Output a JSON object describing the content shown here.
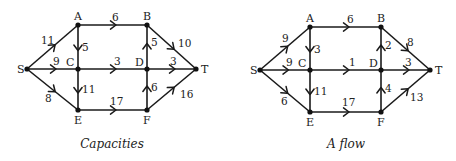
{
  "graphs": [
    {
      "caption": "Capacities",
      "nodes": [
        {
          "id": "S",
          "x": 27,
          "y": 69,
          "lx": 17,
          "ly": 73
        },
        {
          "id": "A",
          "x": 78,
          "y": 25,
          "lx": 74,
          "ly": 20
        },
        {
          "id": "B",
          "x": 147,
          "y": 25,
          "lx": 143,
          "ly": 20
        },
        {
          "id": "C",
          "x": 78,
          "y": 69,
          "lx": 66,
          "ly": 66
        },
        {
          "id": "D",
          "x": 147,
          "y": 69,
          "lx": 135,
          "ly": 66
        },
        {
          "id": "T",
          "x": 196,
          "y": 69,
          "lx": 201,
          "ly": 73
        },
        {
          "id": "E",
          "x": 78,
          "y": 110,
          "lx": 74,
          "ly": 124
        },
        {
          "id": "F",
          "x": 147,
          "y": 110,
          "lx": 143,
          "ly": 124
        }
      ],
      "edges": [
        {
          "from": "S",
          "to": "A",
          "label": "11",
          "lx": 41,
          "ly": 44
        },
        {
          "from": "S",
          "to": "C",
          "label": "9",
          "lx": 53,
          "ly": 65
        },
        {
          "from": "S",
          "to": "E",
          "label": "8",
          "lx": 45,
          "ly": 102
        },
        {
          "from": "A",
          "to": "B",
          "label": "6",
          "lx": 112,
          "ly": 21
        },
        {
          "from": "A",
          "to": "C",
          "label": "5",
          "lx": 82,
          "ly": 51
        },
        {
          "from": "C",
          "to": "D",
          "label": "3",
          "lx": 114,
          "ly": 65
        },
        {
          "from": "C",
          "to": "E",
          "label": "11",
          "lx": 82,
          "ly": 93
        },
        {
          "from": "D",
          "to": "B",
          "label": "5",
          "lx": 151,
          "ly": 46
        },
        {
          "from": "B",
          "to": "T",
          "label": "10",
          "lx": 178,
          "ly": 47
        },
        {
          "from": "D",
          "to": "T",
          "label": "3",
          "lx": 170,
          "ly": 65
        },
        {
          "from": "F",
          "to": "D",
          "label": "6",
          "lx": 151,
          "ly": 91
        },
        {
          "from": "F",
          "to": "T",
          "label": "16",
          "lx": 180,
          "ly": 98
        },
        {
          "from": "E",
          "to": "F",
          "label": "17",
          "lx": 110,
          "ly": 105
        }
      ],
      "caption_x": 112,
      "caption_y": 148
    },
    {
      "caption": "A flow",
      "nodes": [
        {
          "id": "S",
          "x": 260,
          "y": 70,
          "lx": 250,
          "ly": 74
        },
        {
          "id": "A",
          "x": 310,
          "y": 27,
          "lx": 306,
          "ly": 22
        },
        {
          "id": "B",
          "x": 381,
          "y": 27,
          "lx": 377,
          "ly": 22
        },
        {
          "id": "C",
          "x": 310,
          "y": 70,
          "lx": 298,
          "ly": 67
        },
        {
          "id": "D",
          "x": 381,
          "y": 70,
          "lx": 369,
          "ly": 67
        },
        {
          "id": "T",
          "x": 430,
          "y": 70,
          "lx": 435,
          "ly": 74
        },
        {
          "id": "E",
          "x": 310,
          "y": 112,
          "lx": 306,
          "ly": 126
        },
        {
          "id": "F",
          "x": 381,
          "y": 112,
          "lx": 377,
          "ly": 126
        }
      ],
      "edges": [
        {
          "from": "S",
          "to": "A",
          "label": "9",
          "lx": 282,
          "ly": 42
        },
        {
          "from": "S",
          "to": "C",
          "label": "9",
          "lx": 286,
          "ly": 66
        },
        {
          "from": "S",
          "to": "E",
          "label": "6",
          "lx": 281,
          "ly": 105
        },
        {
          "from": "A",
          "to": "B",
          "label": "6",
          "lx": 347,
          "ly": 23
        },
        {
          "from": "A",
          "to": "C",
          "label": "3",
          "lx": 314,
          "ly": 53
        },
        {
          "from": "C",
          "to": "D",
          "label": "1",
          "lx": 349,
          "ly": 66
        },
        {
          "from": "C",
          "to": "E",
          "label": "11",
          "lx": 314,
          "ly": 95
        },
        {
          "from": "D",
          "to": "B",
          "label": "2",
          "lx": 385,
          "ly": 49
        },
        {
          "from": "B",
          "to": "T",
          "label": "8",
          "lx": 407,
          "ly": 46
        },
        {
          "from": "D",
          "to": "T",
          "label": "3",
          "lx": 405,
          "ly": 66
        },
        {
          "from": "F",
          "to": "D",
          "label": "4",
          "lx": 385,
          "ly": 92
        },
        {
          "from": "F",
          "to": "T",
          "label": "13",
          "lx": 410,
          "ly": 101
        },
        {
          "from": "E",
          "to": "F",
          "label": "17",
          "lx": 342,
          "ly": 106
        }
      ],
      "caption_x": 346,
      "caption_y": 148
    }
  ]
}
